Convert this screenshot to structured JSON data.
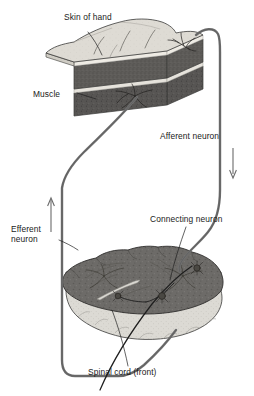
{
  "figure": {
    "background_color": "#ffffff",
    "width": 254,
    "height": 396
  },
  "labels": {
    "skin_of_hand": "Skin of hand",
    "muscle": "Muscle",
    "afferent_neuron": "Afferent neuron",
    "efferent_neuron_line1": "Efferent",
    "efferent_neuron_line2": "neuron",
    "connecting_neuron": "Connecting neuron",
    "spinal_cord": "Spinal cord (front)"
  },
  "structures": {
    "skin_block": {
      "name": "Skin of hand block",
      "skin_top_color": "#dedbd4",
      "skin_side_color": "#cfccc4",
      "dermis_color": "#6e6b66",
      "muscle_color": "#545250",
      "outline_color": "#3a3a38"
    },
    "spinal_cord": {
      "name": "Spinal cord cross-section",
      "gray_matter_color": "#6d6b68",
      "white_matter_color": "#dcdad4",
      "outline_color": "#3a3a38"
    }
  },
  "pathways": {
    "afferent": {
      "name": "Afferent neuron",
      "color": "#6b6b6b",
      "direction": "down",
      "arrow_color": "#6b6b6b"
    },
    "efferent": {
      "name": "Efferent neuron",
      "color": "#6b6b6b",
      "direction": "up",
      "arrow_color": "#6b6b6b"
    },
    "connecting": {
      "name": "Connecting neuron",
      "color": "#1f1f1f"
    }
  },
  "synapses": {
    "count": 3,
    "color": "#3a3a38"
  }
}
